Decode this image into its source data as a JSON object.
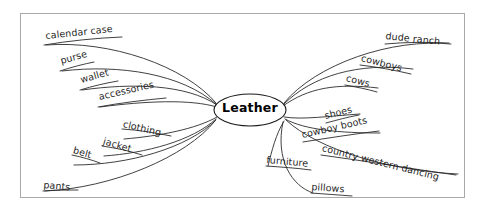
{
  "diagram": {
    "type": "mind-map",
    "center": {
      "label": "Leather",
      "shape": "ellipse"
    },
    "branches": [
      {
        "id": "calendar-case",
        "label": "calendar case",
        "side": "upper-left",
        "x": 46,
        "y": 42,
        "rotate": -6,
        "underline_width": 76
      },
      {
        "id": "purse",
        "label": "purse",
        "side": "upper-left",
        "x": 62,
        "y": 67,
        "rotate": -16,
        "underline_width": 33
      },
      {
        "id": "wallet",
        "label": "wallet",
        "side": "upper-left",
        "x": 82,
        "y": 86,
        "rotate": -16,
        "underline_width": 36
      },
      {
        "id": "accessories",
        "label": "accessories",
        "side": "upper-left",
        "x": 100,
        "y": 103,
        "rotate": -13,
        "underline_width": 66
      },
      {
        "id": "clothing",
        "label": "clothing",
        "side": "lower-left",
        "x": 124,
        "y": 135,
        "rotate": 13,
        "underline_width": 47
      },
      {
        "id": "jacket",
        "label": "jacket",
        "side": "lower-left",
        "x": 104,
        "y": 152,
        "rotate": 16,
        "underline_width": 36
      },
      {
        "id": "belt",
        "label": "belt",
        "side": "lower-left",
        "x": 74,
        "y": 161,
        "rotate": 16,
        "underline_width": 26
      },
      {
        "id": "pants",
        "label": "pants",
        "side": "lower-left",
        "x": 45,
        "y": 188,
        "rotate": 5,
        "underline_width": 34
      },
      {
        "id": "dude-ranch",
        "label": "dude ranch",
        "side": "upper-right",
        "x": 385,
        "y": 41,
        "rotate": 6,
        "underline_width": 66
      },
      {
        "id": "cowboys",
        "label": "cowboys",
        "side": "upper-right",
        "x": 360,
        "y": 62,
        "rotate": 14,
        "underline_width": 52
      },
      {
        "id": "cows",
        "label": "cows",
        "side": "upper-right",
        "x": 345,
        "y": 82,
        "rotate": 14,
        "underline_width": 33
      },
      {
        "id": "shoes",
        "label": "shoes",
        "side": "lower-right",
        "x": 326,
        "y": 120,
        "rotate": -14,
        "underline_width": 34
      },
      {
        "id": "cowboy-boots",
        "label": "cowboy boots",
        "side": "lower-right",
        "x": 305,
        "y": 139,
        "rotate": -13,
        "underline_width": 75
      },
      {
        "id": "country-western-dancing",
        "label": "country western dancing",
        "side": "lower-right",
        "x": 323,
        "y": 152,
        "rotate": 14,
        "underline_width": 135
      },
      {
        "id": "furniture",
        "label": "furniture",
        "side": "lower-right",
        "x": 268,
        "y": 163,
        "rotate": 5,
        "underline_width": 47
      },
      {
        "id": "pillows",
        "label": "pillows",
        "side": "lower-right",
        "x": 313,
        "y": 190,
        "rotate": 4,
        "underline_width": 42
      }
    ],
    "colors": {
      "line": "#2b2b2b",
      "frame": "#a9a9a9",
      "background": "#ffffff",
      "text": "#1f1f1f"
    }
  }
}
